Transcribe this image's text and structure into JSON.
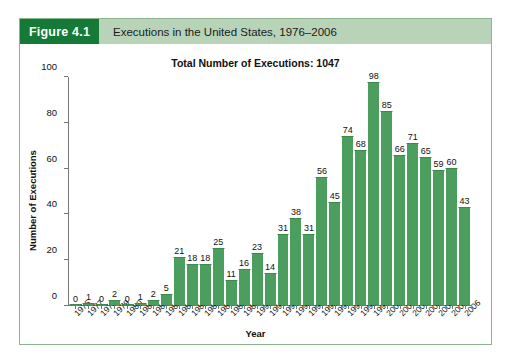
{
  "figure": {
    "badge": "Figure 4.1",
    "caption": "Executions in the United States, 1976–2006"
  },
  "chart_data": {
    "type": "bar",
    "title": "Total Number of Executions: 1047",
    "xlabel": "Year",
    "ylabel": "Number of Executions",
    "ylim": [
      0,
      100
    ],
    "yticks": [
      0,
      20,
      40,
      60,
      80,
      100
    ],
    "grid": false,
    "legend": null,
    "bar_color": "#4c9e5e",
    "categories": [
      "1976",
      "1977",
      "1978",
      "1979",
      "1980",
      "1981",
      "1982",
      "1983",
      "1984",
      "1985",
      "1986",
      "1987",
      "1988",
      "1989",
      "1990",
      "1991",
      "1992",
      "1993",
      "1994",
      "1995",
      "1996",
      "1997",
      "1998",
      "1999",
      "2000",
      "2001",
      "2002",
      "2003",
      "2004",
      "2005",
      "2006"
    ],
    "values": [
      0,
      1,
      0,
      2,
      0,
      1,
      2,
      5,
      21,
      18,
      18,
      25,
      11,
      16,
      23,
      14,
      31,
      38,
      31,
      56,
      45,
      74,
      68,
      98,
      85,
      66,
      71,
      65,
      59,
      60,
      43
    ],
    "data_labels": [
      "0",
      "1",
      "0",
      "2",
      "0",
      "1",
      "2",
      "5",
      "21",
      "18",
      "18",
      "25",
      "11",
      "16",
      "23",
      "14",
      "31",
      "38",
      "31",
      "56",
      "45",
      "74",
      "68",
      "98",
      "85",
      "66",
      "71",
      "65",
      "59",
      "60",
      "43"
    ]
  }
}
